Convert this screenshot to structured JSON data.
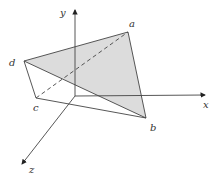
{
  "diagram": {
    "type": "3d-coordinate-tetrahedron",
    "axes": {
      "x": {
        "label": "x"
      },
      "y": {
        "label": "y"
      },
      "z": {
        "label": "z"
      }
    },
    "vertices": {
      "a": {
        "label": "a"
      },
      "b": {
        "label": "b"
      },
      "c": {
        "label": "c"
      },
      "d": {
        "label": "d"
      }
    },
    "shaded_face": [
      "d",
      "a",
      "b"
    ],
    "dashed_edges": [
      [
        "c",
        "a"
      ]
    ],
    "solid_edges": [
      [
        "d",
        "a"
      ],
      [
        "a",
        "b"
      ],
      [
        "d",
        "b"
      ],
      [
        "d",
        "c"
      ],
      [
        "c",
        "b"
      ]
    ],
    "colors": {
      "shade": "#d9d9d9",
      "line": "#444444"
    }
  }
}
